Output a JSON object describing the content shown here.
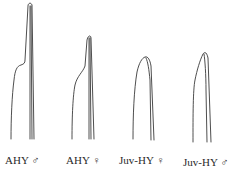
{
  "figure": {
    "stroke_color": "#3a3a3a",
    "feathers": [
      {
        "label": "AHY ♂",
        "age": "AHY",
        "sex": "♂",
        "shape": "emarginated tip with sharp notch"
      },
      {
        "label": "AHY ♀",
        "age": "AHY",
        "sex": "♀",
        "shape": "emarginated tip with gradual notch"
      },
      {
        "label": "Juv-HY ♀",
        "age": "Juv-HY",
        "sex": "♀",
        "shape": "rounded tip, no emargination"
      },
      {
        "label": "Juv-HY ♂",
        "age": "Juv-HY",
        "sex": "♂",
        "shape": "pointed tip, slight emargination"
      }
    ]
  }
}
